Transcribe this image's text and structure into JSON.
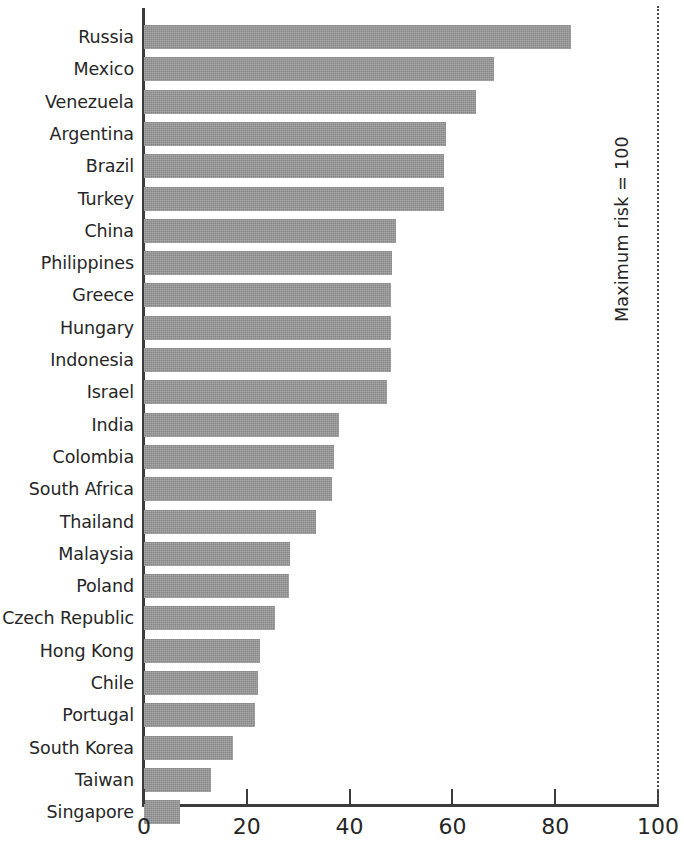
{
  "chart_data": {
    "type": "bar",
    "orientation": "horizontal",
    "title": "",
    "subtitle": "",
    "xlabel": "",
    "ylabel": "",
    "xlim": [
      0,
      100
    ],
    "xticks": [
      0,
      20,
      40,
      60,
      80,
      100
    ],
    "xtick_labels": [
      "0",
      "20",
      "40",
      "60",
      "80",
      "100"
    ],
    "grid": false,
    "legend": null,
    "bar_color": "#878787",
    "axis_color": "#3c3c3c",
    "text_color": "#262626",
    "annotations": [
      {
        "name": "maximum-risk-reference",
        "text": "Maximum risk = 100",
        "value": 100,
        "style": "dotted-vertical-line",
        "rotation": -90
      }
    ],
    "categories": [
      "Russia",
      "Mexico",
      "Venezuela",
      "Argentina",
      "Brazil",
      "Turkey",
      "China",
      "Philippines",
      "Greece",
      "Hungary",
      "Indonesia",
      "Israel",
      "India",
      "Colombia",
      "South Africa",
      "Thailand",
      "Malaysia",
      "Poland",
      "Czech Republic",
      "Hong Kong",
      "Chile",
      "Portugal",
      "South Korea",
      "Taiwan",
      "Singapore"
    ],
    "values": [
      83,
      68,
      64.5,
      58.8,
      58.4,
      58.3,
      49,
      48.2,
      48,
      48,
      48,
      47.2,
      38,
      37,
      36.5,
      33.5,
      28.5,
      28.3,
      25.5,
      22.5,
      22.2,
      21.5,
      17.3,
      13,
      7
    ]
  },
  "figure": {
    "background": "#ffffff",
    "width": 684,
    "height": 865
  }
}
